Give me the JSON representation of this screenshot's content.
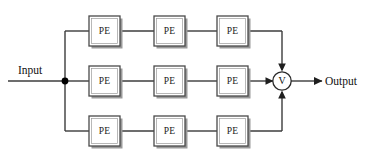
{
  "diagram": {
    "type": "block-diagram",
    "canvas": {
      "width": 377,
      "height": 165,
      "background": "#ffffff"
    },
    "colors": {
      "wire": "#3c3c3c",
      "box_stroke": "#4a4a4a",
      "box_fill": "#ffffff",
      "box_shadow": "#9a9a9a",
      "text": "#111111",
      "arrow": "#1f1f1f",
      "junction": "#000000"
    },
    "input": {
      "label": "Input",
      "label_x": 18,
      "label_y": 74,
      "line_from_x": 8,
      "line_to_x": 65,
      "y": 81
    },
    "output": {
      "label": "Output",
      "label_x": 325,
      "label_y": 85,
      "line_from_x": 291,
      "line_to_x": 320,
      "y": 81
    },
    "junction": {
      "name": "input-fanout-junction",
      "x": 65,
      "y": 81,
      "radius": 3.4
    },
    "merge_node": {
      "name": "fusion-node",
      "label": "V",
      "cx": 282,
      "cy": 81,
      "r": 9.2
    },
    "bus": {
      "left_x": 65,
      "right_x": 282,
      "top_y": 31,
      "mid_y": 81,
      "bottom_y": 131
    },
    "rows": [
      {
        "name": "top-branch",
        "y": 31,
        "box_top": 16,
        "box_height": 30,
        "blocks": [
          {
            "label": "PE",
            "x": 89,
            "width": 31
          },
          {
            "label": "PE",
            "x": 154,
            "width": 31
          },
          {
            "label": "PE",
            "x": 217,
            "width": 31
          }
        ]
      },
      {
        "name": "middle-branch",
        "y": 81,
        "box_top": 66,
        "box_height": 30,
        "blocks": [
          {
            "label": "PE",
            "x": 89,
            "width": 31
          },
          {
            "label": "PE",
            "x": 154,
            "width": 31
          },
          {
            "label": "PE",
            "x": 217,
            "width": 31
          }
        ]
      },
      {
        "name": "bottom-branch",
        "y": 131,
        "box_top": 116,
        "box_height": 30,
        "blocks": [
          {
            "label": "PE",
            "x": 89,
            "width": 31
          },
          {
            "label": "PE",
            "x": 154,
            "width": 31
          },
          {
            "label": "PE",
            "x": 217,
            "width": 31
          }
        ]
      }
    ],
    "arrows": [
      {
        "name": "arrow-top-into-merge",
        "direction": "down",
        "x": 282,
        "y": 69
      },
      {
        "name": "arrow-middle-into-merge",
        "direction": "right",
        "x": 270,
        "y": 81
      },
      {
        "name": "arrow-bottom-into-merge",
        "direction": "up",
        "x": 282,
        "y": 93
      },
      {
        "name": "arrow-merge-to-output",
        "direction": "right",
        "x": 320,
        "y": 81
      }
    ]
  }
}
